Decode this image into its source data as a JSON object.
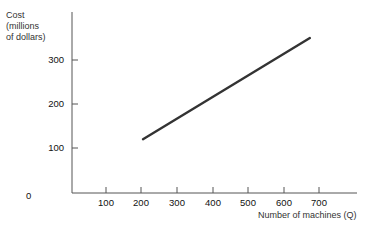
{
  "chart_data": {
    "type": "line",
    "title": "",
    "xlabel": "Number of machines (Q)",
    "ylabel": "Cost (millions of dollars)",
    "ylabel_lines": [
      "Cost",
      "(millions",
      "of dollars)"
    ],
    "x_ticks": [
      100,
      200,
      300,
      400,
      500,
      600,
      700
    ],
    "y_ticks": [
      100,
      200,
      300
    ],
    "origin_label": "0",
    "xlim": [
      0,
      800
    ],
    "ylim": [
      0,
      400
    ],
    "grid": false,
    "legend": null,
    "series": [
      {
        "name": "Cost",
        "x": [
          200,
          670
        ],
        "y": [
          120,
          350
        ]
      }
    ]
  }
}
